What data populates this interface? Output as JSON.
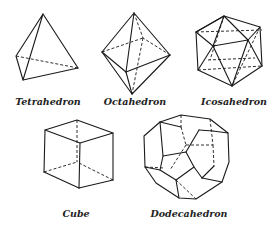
{
  "figure": {
    "solids": [
      {
        "id": "tetrahedron",
        "label": "Tetrahedron"
      },
      {
        "id": "octahedron",
        "label": "Octahedron"
      },
      {
        "id": "icosahedron",
        "label": "Icosahedron"
      },
      {
        "id": "cube",
        "label": "Cube"
      },
      {
        "id": "dodecahedron",
        "label": "Dodecahedron"
      }
    ]
  }
}
